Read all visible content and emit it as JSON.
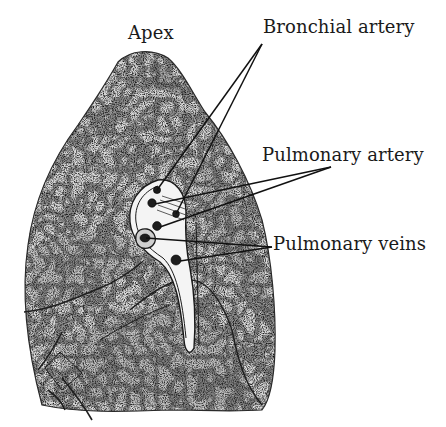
{
  "figure": {
    "background": "#ffffff",
    "ink": "#1a1a1a",
    "labels": [
      {
        "id": "apex",
        "text": "Apex",
        "x": 128,
        "y": 24
      },
      {
        "id": "bronchial-artery",
        "text": "Bronchial artery",
        "x": 263,
        "y": 18
      },
      {
        "id": "pulmonary-artery",
        "text": "Pulmonary artery",
        "x": 262,
        "y": 146
      },
      {
        "id": "pulmonary-veins",
        "text": "Pulmonary veins",
        "x": 273,
        "y": 235
      }
    ],
    "leaders": [
      {
        "label": "bronchial-artery",
        "from": [
          262,
          44
        ],
        "to": [
          [
            157,
            190
          ],
          [
            176,
            214
          ]
        ]
      },
      {
        "label": "pulmonary-artery",
        "from": [
          331,
          167
        ],
        "to": [
          [
            155,
            204
          ],
          [
            160,
            227
          ]
        ]
      },
      {
        "label": "pulmonary-veins",
        "from": [
          272,
          247
        ],
        "to": [
          [
            146,
            238
          ],
          [
            180,
            261
          ]
        ]
      }
    ]
  }
}
